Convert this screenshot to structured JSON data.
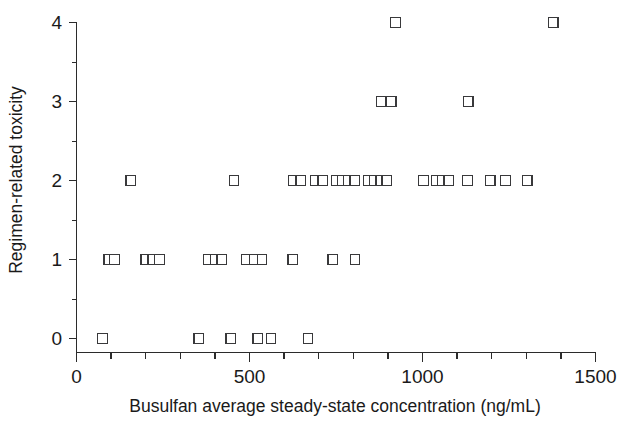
{
  "chart_data": {
    "type": "scatter",
    "title": "",
    "xlabel": "Busulfan average steady-state concentration (ng/mL)",
    "ylabel": "Regimen-related toxicity",
    "xlim": [
      0,
      1500
    ],
    "ylim": [
      0,
      4
    ],
    "x_major_ticks": [
      0,
      500,
      1000,
      1500
    ],
    "x_major_tick_labels": [
      "0",
      "500",
      "1000",
      "1500"
    ],
    "x_minor_tick_step": 100,
    "y_major_ticks": [
      0,
      1,
      2,
      3,
      4
    ],
    "y_major_tick_labels": [
      "0",
      "1",
      "2",
      "3",
      "4"
    ],
    "y_minor_tick_step": 0.5,
    "grid": false,
    "legend": false,
    "marker": "open-square",
    "marker_color": "#39393b",
    "marker_fill": "#ffffff",
    "points": [
      {
        "x": 75,
        "y": 0
      },
      {
        "x": 353,
        "y": 0
      },
      {
        "x": 446,
        "y": 0
      },
      {
        "x": 524,
        "y": 0
      },
      {
        "x": 562,
        "y": 0
      },
      {
        "x": 669,
        "y": 0
      },
      {
        "x": 93,
        "y": 1
      },
      {
        "x": 110,
        "y": 1
      },
      {
        "x": 200,
        "y": 1
      },
      {
        "x": 220,
        "y": 1
      },
      {
        "x": 240,
        "y": 1
      },
      {
        "x": 380,
        "y": 1
      },
      {
        "x": 400,
        "y": 1
      },
      {
        "x": 420,
        "y": 1
      },
      {
        "x": 490,
        "y": 1
      },
      {
        "x": 513,
        "y": 1
      },
      {
        "x": 536,
        "y": 1
      },
      {
        "x": 625,
        "y": 1
      },
      {
        "x": 741,
        "y": 1
      },
      {
        "x": 805,
        "y": 1
      },
      {
        "x": 157,
        "y": 2
      },
      {
        "x": 455,
        "y": 2
      },
      {
        "x": 626,
        "y": 2
      },
      {
        "x": 648,
        "y": 2
      },
      {
        "x": 690,
        "y": 2
      },
      {
        "x": 712,
        "y": 2
      },
      {
        "x": 750,
        "y": 2
      },
      {
        "x": 768,
        "y": 2
      },
      {
        "x": 786,
        "y": 2
      },
      {
        "x": 804,
        "y": 2
      },
      {
        "x": 843,
        "y": 2
      },
      {
        "x": 861,
        "y": 2
      },
      {
        "x": 879,
        "y": 2
      },
      {
        "x": 897,
        "y": 2
      },
      {
        "x": 1003,
        "y": 2
      },
      {
        "x": 1040,
        "y": 2
      },
      {
        "x": 1058,
        "y": 2
      },
      {
        "x": 1076,
        "y": 2
      },
      {
        "x": 1130,
        "y": 2
      },
      {
        "x": 1196,
        "y": 2
      },
      {
        "x": 1240,
        "y": 2
      },
      {
        "x": 1303,
        "y": 2
      },
      {
        "x": 880,
        "y": 3
      },
      {
        "x": 910,
        "y": 3
      },
      {
        "x": 1132,
        "y": 3
      },
      {
        "x": 922,
        "y": 4
      },
      {
        "x": 1378,
        "y": 4
      }
    ]
  },
  "axes": {
    "x_title": "Busulfan average steady-state concentration (ng/mL)",
    "y_title": "Regimen-related toxicity",
    "x_labels": [
      "0",
      "500",
      "1000",
      "1500"
    ],
    "y_labels": [
      "0",
      "1",
      "2",
      "3",
      "4"
    ]
  }
}
